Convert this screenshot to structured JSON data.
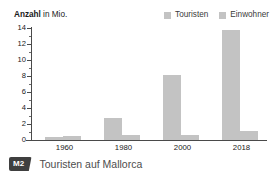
{
  "chart_data": {
    "type": "bar",
    "title": "Anzahl in Mio.",
    "title_strong": "Anzahl",
    "title_rest": " in Mio.",
    "xlabel": "",
    "ylabel": "Anzahl in Mio.",
    "categories": [
      "1960",
      "1980",
      "2000",
      "2018"
    ],
    "series": [
      {
        "name": "Touristen",
        "values": [
          0.4,
          2.8,
          8.1,
          13.8
        ],
        "color": "#c3c3c3"
      },
      {
        "name": "Einwohner",
        "values": [
          0.44,
          0.6,
          0.6,
          1.1
        ],
        "color": "#c3c3c3"
      }
    ],
    "ylim": [
      0,
      14
    ],
    "ytick_values": [
      0,
      2,
      4,
      6,
      8,
      10,
      12,
      14
    ],
    "ytick_labels": [
      "0",
      "2",
      "4",
      "6",
      "8",
      "10",
      "12",
      "14"
    ],
    "yminor_step": 1,
    "grid": false,
    "legend_position": "top-right"
  },
  "legend": {
    "items": [
      {
        "label": "Touristen",
        "color": "#c3c3c3"
      },
      {
        "label": "Einwohner",
        "color": "#c3c3c3"
      }
    ]
  },
  "caption": {
    "badge": "M2",
    "text": "Touristen auf Mallorca"
  },
  "colors": {
    "bar": "#c3c3c3",
    "axis": "#4a4a4a",
    "text": "#1a1a1a",
    "caption_text": "#4d4d4d",
    "badge_bg": "#3f3f3f"
  }
}
